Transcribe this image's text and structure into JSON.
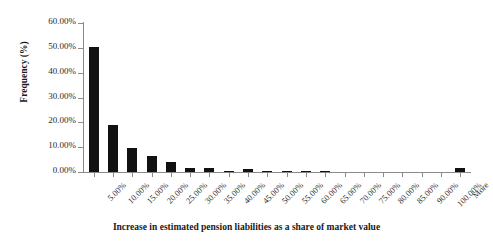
{
  "chart_data": {
    "type": "bar",
    "title": "",
    "xlabel": "Increase in estimated pension liabilities as a share of market value",
    "ylabel": "Frequency (%)",
    "categories": [
      "5.00%",
      "10.00%",
      "15.00%",
      "20.00%",
      "25.00%",
      "30.00%",
      "35.00%",
      "40.00%",
      "45.00%",
      "50.00%",
      "55.00%",
      "60.00%",
      "65.00%",
      "70.00%",
      "75.00%",
      "80.00%",
      "85.00%",
      "90.00%",
      "100.00%",
      "More"
    ],
    "values": [
      50.3,
      19.0,
      9.7,
      6.4,
      4.0,
      1.6,
      1.7,
      0.6,
      1.2,
      0.4,
      0.5,
      0.3,
      0.4,
      0.0,
      0.0,
      0.0,
      0.0,
      0.0,
      0.0,
      1.5
    ],
    "ylim": [
      0,
      60
    ],
    "yticks": [
      0,
      10,
      20,
      30,
      40,
      50,
      60
    ],
    "ytick_labels": [
      "0.00%",
      "10.00%",
      "20.00%",
      "30.00%",
      "40.00%",
      "50.00%",
      "60.00%"
    ],
    "grid": false,
    "legend": false,
    "bar_color": "#111111",
    "axis_color": "#8a8a8a"
  }
}
